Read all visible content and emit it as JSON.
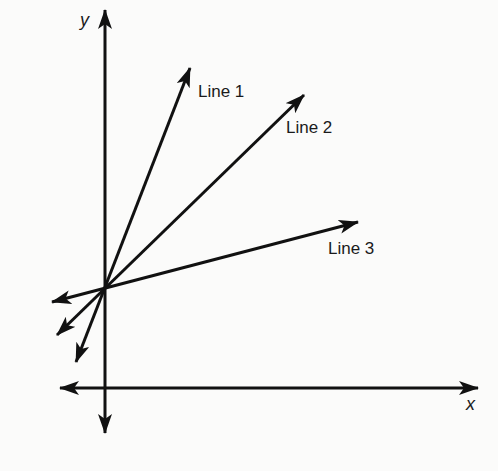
{
  "diagram": {
    "type": "coordinate-plane-lines",
    "stroke_color": "#111111",
    "background": "#fbfbfa",
    "axes": {
      "x_label": "x",
      "y_label": "y",
      "origin_px": [
        105,
        388
      ]
    },
    "intersection_px": [
      105,
      289
    ],
    "lines": [
      {
        "name": "Line 1",
        "tip_px": [
          190,
          68
        ],
        "tail_px": [
          76,
          362
        ]
      },
      {
        "name": "Line 2",
        "tip_px": [
          304,
          95
        ],
        "tail_px": [
          57,
          335
        ]
      },
      {
        "name": "Line 3",
        "tip_px": [
          358,
          222
        ],
        "tail_px": [
          52,
          302
        ]
      }
    ]
  },
  "labels": {
    "line1": "Line 1",
    "line2": "Line 2",
    "line3": "Line 3",
    "x_axis": "x",
    "y_axis": "y"
  }
}
